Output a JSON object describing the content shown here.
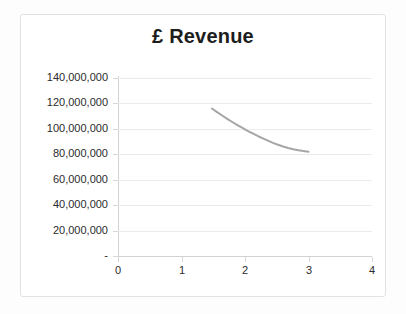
{
  "chart_data": {
    "type": "line",
    "title": "£ Revenue",
    "xlabel": "",
    "ylabel": "",
    "xlim": [
      0,
      4
    ],
    "ylim": [
      0,
      140000000
    ],
    "grid": true,
    "legend": "none",
    "series_color": "#a6a6a6",
    "x_ticks": [
      "0",
      "1",
      "2",
      "3",
      "4"
    ],
    "x_tick_values": [
      0,
      1,
      2,
      3,
      4
    ],
    "y_ticks": [
      "-",
      "20,000,000",
      "40,000,000",
      "60,000,000",
      "80,000,000",
      "100,000,000",
      "120,000,000",
      "140,000,000"
    ],
    "y_tick_values": [
      0,
      20000000,
      40000000,
      60000000,
      80000000,
      100000000,
      120000000,
      140000000
    ],
    "series": [
      {
        "name": "Revenue",
        "x": [
          1.48,
          1.56,
          1.64,
          1.72,
          1.8,
          1.88,
          1.96,
          2.04,
          2.12,
          2.2,
          2.28,
          2.36,
          2.44,
          2.52,
          2.6,
          2.68,
          2.76,
          2.84,
          2.92,
          3.0
        ],
        "values": [
          116000000,
          113200000,
          110500000,
          107900000,
          105400000,
          103000000,
          100700000,
          98500000,
          96400000,
          94400000,
          92500000,
          90700000,
          89000000,
          87500000,
          86100000,
          84900000,
          83900000,
          83100000,
          82500000,
          82000000
        ]
      }
    ]
  }
}
